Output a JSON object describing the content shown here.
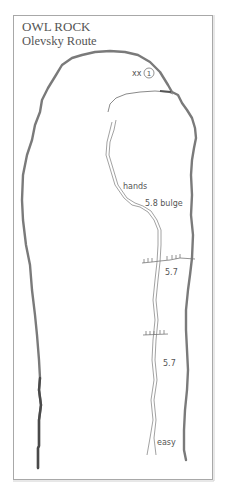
{
  "title": {
    "main": "OWL ROCK",
    "subtitle": "Olevsky Route"
  },
  "anchor": {
    "prefix": "xx",
    "pitch_number": "1"
  },
  "route_labels": {
    "hands": "hands",
    "bulge": "5.8 bulge",
    "grade_upper": "5.7",
    "grade_lower": "5.7",
    "easy": "easy"
  },
  "colors": {
    "frame": "#9a9a9a",
    "rock_outline": "#7a7a7a",
    "route_line": "#8a8a8a",
    "text": "#555555",
    "background": "#ffffff"
  }
}
